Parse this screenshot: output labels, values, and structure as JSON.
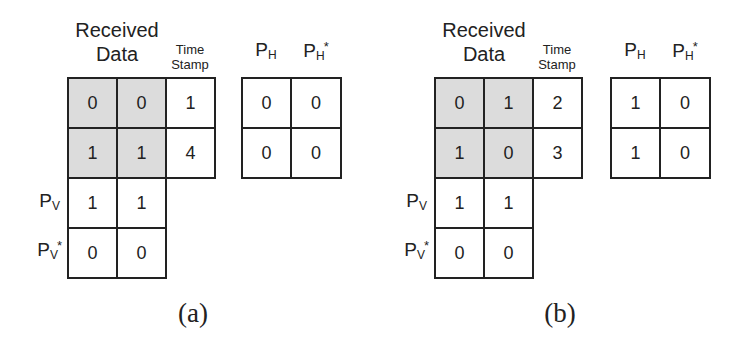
{
  "figure": {
    "panels": [
      {
        "caption": "(a)",
        "headers": {
          "received_line1": "Received",
          "received_line2": "Data",
          "timestamp_line1": "Time",
          "timestamp_line2": "Stamp",
          "ph_base": "P",
          "ph_sub": "H",
          "phs_base": "P",
          "phs_sub": "H",
          "phs_sup": "*"
        },
        "received_data": [
          [
            "0",
            "0"
          ],
          [
            "1",
            "1"
          ]
        ],
        "timestamps": [
          "1",
          "4"
        ],
        "p_h": [
          "0",
          "0"
        ],
        "p_h_star": [
          "0",
          "0"
        ],
        "row_labels": {
          "pv_base": "P",
          "pv_sub": "V",
          "pvs_base": "P",
          "pvs_sub": "V",
          "pvs_sup": "*"
        },
        "p_v": [
          "1",
          "1"
        ],
        "p_v_star": [
          "0",
          "0"
        ]
      },
      {
        "caption": "(b)",
        "headers": {
          "received_line1": "Received",
          "received_line2": "Data",
          "timestamp_line1": "Time",
          "timestamp_line2": "Stamp",
          "ph_base": "P",
          "ph_sub": "H",
          "phs_base": "P",
          "phs_sub": "H",
          "phs_sup": "*"
        },
        "received_data": [
          [
            "0",
            "1"
          ],
          [
            "1",
            "0"
          ]
        ],
        "timestamps": [
          "2",
          "3"
        ],
        "p_h": [
          "1",
          "1"
        ],
        "p_h_star": [
          "0",
          "0"
        ],
        "row_labels": {
          "pv_base": "P",
          "pv_sub": "V",
          "pvs_base": "P",
          "pvs_sub": "V",
          "pvs_sup": "*"
        },
        "p_v": [
          "1",
          "1"
        ],
        "p_v_star": [
          "0",
          "0"
        ]
      }
    ],
    "colors": {
      "shaded_cell": "#dcdcdc",
      "border": "#222222"
    }
  }
}
